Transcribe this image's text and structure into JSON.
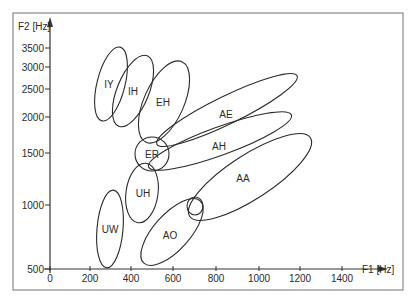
{
  "chart_data": {
    "type": "scatter",
    "subtype": "vowel-formant-ellipses",
    "title": "",
    "xlabel": "F1 [Hz]",
    "ylabel": "F2 [Hz]",
    "xlim": [
      0,
      1600
    ],
    "ylim": [
      500,
      4000
    ],
    "yscale": "log",
    "grid": false,
    "legend": "none",
    "x_ticks": [
      0,
      200,
      400,
      600,
      800,
      1000,
      1200,
      1400
    ],
    "y_ticks": [
      500,
      1000,
      1500,
      2000,
      2500,
      3000,
      3500
    ],
    "regions": [
      {
        "label": "IY",
        "f1_center": 300,
        "f2_center": 2500
      },
      {
        "label": "IH",
        "f1_center": 400,
        "f2_center": 2300
      },
      {
        "label": "EH",
        "f1_center": 540,
        "f2_center": 2100
      },
      {
        "label": "AE",
        "f1_center": 850,
        "f2_center": 1900
      },
      {
        "label": "AH",
        "f1_center": 800,
        "f2_center": 1450
      },
      {
        "label": "AA",
        "f1_center": 950,
        "f2_center": 1150
      },
      {
        "label": "ER",
        "f1_center": 490,
        "f2_center": 1500
      },
      {
        "label": "UH",
        "f1_center": 450,
        "f2_center": 1100
      },
      {
        "label": "UW",
        "f1_center": 290,
        "f2_center": 800
      },
      {
        "label": "AO",
        "f1_center": 570,
        "f2_center": 780
      }
    ]
  },
  "layout": {
    "frame": {
      "x": 13,
      "y": 13,
      "w": 390,
      "h": 277
    },
    "origin": {
      "x": 50,
      "y": 269
    },
    "x_axis_end": 388,
    "y_axis_end": 17,
    "x_tick_px": [
      50,
      90,
      131,
      173,
      216,
      259,
      300,
      342
    ],
    "y_tick_px": [
      269,
      205,
      153,
      117,
      89,
      67,
      48
    ],
    "xlabel_pos": {
      "x": 362,
      "y": 273
    },
    "ylabel_pos": {
      "x": 18,
      "y": 30
    }
  },
  "ellipses": [
    {
      "label": "IY",
      "cx": 111,
      "cy": 84,
      "rx": 14,
      "ry": 38,
      "rot": 14,
      "lx": 109,
      "ly": 88
    },
    {
      "label": "IH",
      "cx": 133,
      "cy": 91,
      "rx": 16,
      "ry": 38,
      "rot": 22,
      "lx": 133,
      "ly": 95
    },
    {
      "label": "EH",
      "cx": 164,
      "cy": 102,
      "rx": 20,
      "ry": 44,
      "rot": 24,
      "lx": 163,
      "ly": 106
    },
    {
      "label": "AE",
      "cx": 227,
      "cy": 110,
      "rx": 78,
      "ry": 14,
      "rot": -26,
      "lx": 226,
      "ly": 118
    },
    {
      "label": "AH",
      "cx": 220,
      "cy": 141,
      "rx": 76,
      "ry": 14,
      "rot": -20,
      "lx": 219,
      "ly": 150
    },
    {
      "label": "AA",
      "cx": 250,
      "cy": 177,
      "rx": 72,
      "ry": 22,
      "rot": -33,
      "lx": 243,
      "ly": 182
    },
    {
      "label": "ER",
      "cx": 152,
      "cy": 154,
      "rx": 17,
      "ry": 17,
      "rot": 0,
      "lx": 152,
      "ly": 158
    },
    {
      "label": "UH",
      "cx": 142,
      "cy": 193,
      "rx": 16,
      "ry": 30,
      "rot": 8,
      "lx": 143,
      "ly": 197
    },
    {
      "label": "UW",
      "cx": 110,
      "cy": 229,
      "rx": 13,
      "ry": 39,
      "rot": 5,
      "lx": 110,
      "ly": 233
    },
    {
      "label": "AO",
      "cx": 172,
      "cy": 232,
      "rx": 18,
      "ry": 42,
      "rot": 42,
      "lx": 170,
      "ly": 239
    },
    {
      "label": "",
      "cx": 195,
      "cy": 206,
      "rx": 8,
      "ry": 9,
      "rot": 0,
      "lx": 0,
      "ly": 0
    }
  ],
  "colors": {
    "line": "#2a2a2a",
    "frame": "#8a8a8a",
    "background": "#ffffff"
  }
}
